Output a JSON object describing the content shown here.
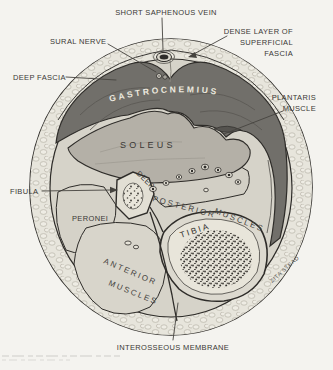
{
  "figure": {
    "colors": {
      "paper": "#f4f3ef",
      "ink": "#2e2c29",
      "label_text": "#3a3835",
      "muscle_dark": "#716f6a",
      "muscle_mid": "#b4b0a7",
      "interior": "#d6d3c9",
      "fat_ring": "#e7e5dc",
      "bone": "#dcd9cf",
      "gastro_text": "#ece9df"
    },
    "labels": {
      "short_saphenous_vein": "SHORT SAPHENOUS VEIN",
      "sural_nerve": "SURAL NERVE",
      "dense_layer_line1": "DENSE LAYER OF",
      "dense_layer_line2": "SUPERFICIAL",
      "dense_layer_line3": "FASCIA",
      "deep_fascia": "DEEP FASCIA",
      "plantaris_line1": "PLANTARIS",
      "plantaris_line2": "MUSCLE",
      "gastrocnemius": "GASTROCNEMIUS",
      "soleus": "SOLEUS",
      "deep_posterior_word1": "DEEP",
      "deep_posterior_word2": "POSTERIOR",
      "deep_posterior_word3": "MUSCLES",
      "fibula": "FIBULA",
      "peronei": "PERONEI",
      "tibia": "TIBIA",
      "anterior_line1": "ANTERIOR",
      "anterior_line2": "MUSCLES",
      "interosseous_membrane": "INTEROSSEOUS MEMBRANE",
      "artist_signature": "ZITA STEAD"
    }
  }
}
